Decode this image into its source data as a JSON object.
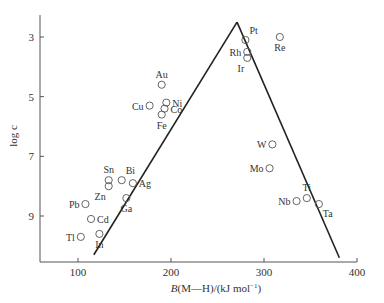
{
  "chart_data": {
    "type": "scatter",
    "title": "",
    "xlabel": "B(M—H)/(kJ mol⁻¹)",
    "xlabel_italic": "B",
    "xlabel_rest": "(M—H)/(kJ mol",
    "xlabel_sup": "−1",
    "xlabel_close": ")",
    "ylabel": "log c",
    "xlim": [
      60,
      400
    ],
    "ylim": [
      10.5,
      2.2
    ],
    "y_inverted": true,
    "grid": false,
    "legend": null,
    "x_ticks": [
      100,
      200,
      300,
      400
    ],
    "y_ticks": [
      3,
      5,
      7,
      9
    ],
    "points": [
      {
        "label": "Pt",
        "x": 280,
        "y": 3.1,
        "label_pos": "above-right"
      },
      {
        "label": "Re",
        "x": 317,
        "y": 3.0,
        "label_pos": "below"
      },
      {
        "label": "Rh",
        "x": 282,
        "y": 3.5,
        "label_pos": "left"
      },
      {
        "label": "Ir",
        "x": 282,
        "y": 3.7,
        "label_pos": "below-left"
      },
      {
        "label": "Au",
        "x": 190,
        "y": 4.6,
        "label_pos": "above"
      },
      {
        "label": "Cu",
        "x": 177,
        "y": 5.3,
        "label_pos": "left"
      },
      {
        "label": "Ni",
        "x": 195,
        "y": 5.2,
        "label_pos": "right"
      },
      {
        "label": "Co",
        "x": 193,
        "y": 5.4,
        "label_pos": "right"
      },
      {
        "label": "Fe",
        "x": 190,
        "y": 5.6,
        "label_pos": "below"
      },
      {
        "label": "W",
        "x": 309,
        "y": 6.6,
        "label_pos": "left"
      },
      {
        "label": "Mo",
        "x": 306,
        "y": 7.4,
        "label_pos": "left"
      },
      {
        "label": "Ti",
        "x": 346,
        "y": 8.4,
        "label_pos": "above"
      },
      {
        "label": "Nb",
        "x": 335,
        "y": 8.5,
        "label_pos": "left"
      },
      {
        "label": "Ta",
        "x": 359,
        "y": 8.6,
        "label_pos": "below-right"
      },
      {
        "label": "Sn",
        "x": 133,
        "y": 7.8,
        "label_pos": "above"
      },
      {
        "label": "Zn",
        "x": 133,
        "y": 8.0,
        "label_pos": "below-left"
      },
      {
        "label": "Bi",
        "x": 147,
        "y": 7.8,
        "label_pos": "above-right"
      },
      {
        "label": "Ag",
        "x": 159,
        "y": 7.9,
        "label_pos": "right"
      },
      {
        "label": "Ga",
        "x": 152,
        "y": 8.4,
        "label_pos": "below"
      },
      {
        "label": "Pb",
        "x": 108,
        "y": 8.6,
        "label_pos": "left"
      },
      {
        "label": "Cd",
        "x": 114,
        "y": 9.1,
        "label_pos": "right"
      },
      {
        "label": "Tl",
        "x": 103,
        "y": 9.7,
        "label_pos": "left"
      },
      {
        "label": "In",
        "x": 123,
        "y": 9.6,
        "label_pos": "below"
      }
    ],
    "lines": [
      {
        "name": "left-branch",
        "x": [
          117,
          271
        ],
        "y": [
          10.3,
          2.5
        ]
      },
      {
        "name": "right-branch",
        "x": [
          271,
          381
        ],
        "y": [
          2.5,
          10.4
        ]
      }
    ]
  },
  "colors": {
    "axis": "#555555",
    "line": "#222222",
    "marker": "#555555",
    "text": "#333333"
  }
}
